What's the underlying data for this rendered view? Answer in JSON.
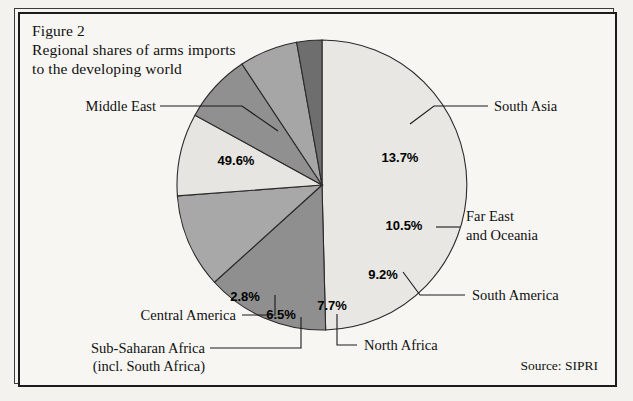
{
  "figure": {
    "title_line1": "Figure 2",
    "title_line2": "Regional shares of arms imports",
    "title_line3": "to the developing world",
    "source": "Source: SIPRI"
  },
  "chart_data": {
    "type": "pie",
    "title": "Regional shares of arms imports to the developing world",
    "subtitle": "Figure 2",
    "source": "Source: SIPRI",
    "value_unit": "percent",
    "legend_position": "callout-labels",
    "grid": false,
    "start_angle_deg": -90,
    "direction": "clockwise",
    "categories": [
      "Middle East",
      "South Asia",
      "Far East and Oceania",
      "South America",
      "North Africa",
      "Sub-Saharan Africa (incl. South Africa)",
      "Central America"
    ],
    "values": [
      49.6,
      13.7,
      10.5,
      9.2,
      7.7,
      6.5,
      2.8
    ],
    "labels": [
      "49.6%",
      "13.7%",
      "10.5%",
      "9.2%",
      "7.7%",
      "6.5%",
      "2.8%"
    ],
    "colors": [
      "#e8e7e3",
      "#8f8f8f",
      "#a8a8a8",
      "#e6e5e1",
      "#909090",
      "#a6a6a6",
      "#6e6e6e"
    ],
    "slices": [
      {
        "name": "Middle East",
        "value": 49.6,
        "label": "49.6%",
        "callout": "Middle East",
        "color": "#e8e7e3"
      },
      {
        "name": "South Asia",
        "value": 13.7,
        "label": "13.7%",
        "callout": "South Asia",
        "color": "#8f8f8f"
      },
      {
        "name": "Far East and Oceania",
        "value": 10.5,
        "label": "10.5%",
        "callout_line1": "Far East",
        "callout_line2": "and Oceania",
        "color": "#a8a8a8"
      },
      {
        "name": "South America",
        "value": 9.2,
        "label": "9.2%",
        "callout": "South America",
        "color": "#e6e5e1"
      },
      {
        "name": "North Africa",
        "value": 7.7,
        "label": "7.7%",
        "callout": "North Africa",
        "color": "#909090"
      },
      {
        "name": "Sub-Saharan Africa",
        "value": 6.5,
        "label": "6.5%",
        "callout_line1": "Sub-Saharan Africa",
        "callout_line2": "(incl. South Africa)",
        "color": "#a6a6a6"
      },
      {
        "name": "Central America",
        "value": 2.8,
        "label": "2.8%",
        "callout": "Central America",
        "color": "#6e6e6e"
      }
    ]
  }
}
